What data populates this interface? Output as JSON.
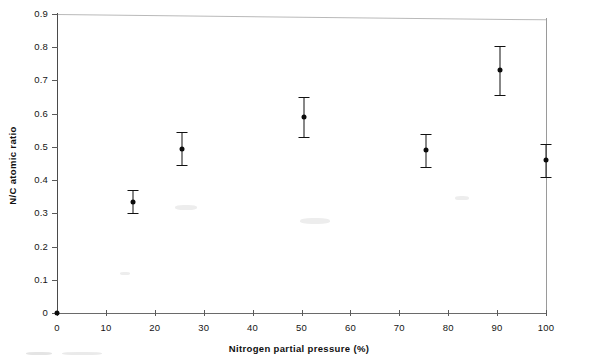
{
  "chart_data": {
    "type": "scatter",
    "title": "",
    "xlabel": "Nitrogen partial pressure (%)",
    "ylabel": "N/C atomic ratio",
    "xlim": [
      0,
      100
    ],
    "ylim": [
      0,
      0.9
    ],
    "xticks": [
      0,
      10,
      20,
      30,
      40,
      50,
      60,
      70,
      80,
      90,
      100
    ],
    "xtick_labels": [
      "0",
      "10",
      "20",
      "30",
      "40",
      "50",
      "60",
      "70",
      "80",
      "90",
      "100"
    ],
    "yticks": [
      0,
      0.1,
      0.2,
      0.3,
      0.4,
      0.5,
      0.6,
      0.7,
      0.8,
      0.9
    ],
    "ytick_labels": [
      "0",
      "0.1",
      "0.2",
      "0.3",
      "0.4",
      "0.5",
      "0.6",
      "0.7",
      "0.8",
      "0.9"
    ],
    "grid": false,
    "legend": false,
    "marker": "filled-circle",
    "error_bars": "vertical",
    "series": [
      {
        "name": "N/C atomic ratio",
        "points": [
          {
            "x": 0,
            "y": 0.0,
            "yerr": 0.0
          },
          {
            "x": 15.5,
            "y": 0.335,
            "yerr": 0.035
          },
          {
            "x": 25.5,
            "y": 0.495,
            "yerr": 0.05
          },
          {
            "x": 50.5,
            "y": 0.59,
            "yerr": 0.06
          },
          {
            "x": 75.5,
            "y": 0.49,
            "yerr": 0.05
          },
          {
            "x": 90.5,
            "y": 0.73,
            "yerr": 0.075
          },
          {
            "x": 100,
            "y": 0.46,
            "yerr": 0.05
          }
        ]
      }
    ]
  },
  "figure": {
    "caption": ""
  },
  "colors": {
    "marker": "#0b0b0b",
    "axis": "#4a4a4a",
    "text": "#111111",
    "background": "#ffffff"
  }
}
